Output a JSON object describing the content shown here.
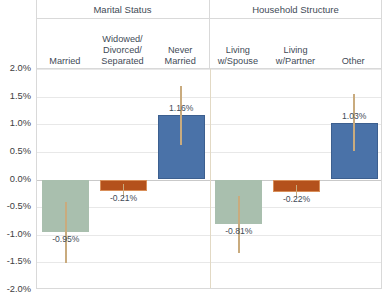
{
  "header": {
    "groups": [
      {
        "label": "Marital Status"
      },
      {
        "label": "Household Structure"
      }
    ],
    "categories": [
      {
        "lines": [
          "Married"
        ]
      },
      {
        "lines": [
          "Widowed/",
          "Divorced/",
          "Separated"
        ]
      },
      {
        "lines": [
          "Never",
          "Married"
        ]
      },
      {
        "lines": [
          "Living",
          "w/Spouse"
        ]
      },
      {
        "lines": [
          "Living",
          "w/Partner"
        ]
      },
      {
        "lines": [
          "Other"
        ]
      }
    ]
  },
  "axis": {
    "ticks": [
      "2.0%",
      "1.5%",
      "1.0%",
      "0.5%",
      "0.0%",
      "-0.5%",
      "-1.0%",
      "-1.5%",
      "-2.0%"
    ],
    "tick_values": [
      2.0,
      1.5,
      1.0,
      0.5,
      0.0,
      -0.5,
      -1.0,
      -1.5,
      -2.0
    ]
  },
  "colors": {
    "green": "#a9bfae",
    "green_border": "#a9bfae",
    "rust": "#b4511c",
    "rust_border": "#d98f5a",
    "blue": "#4a72a8",
    "blue_border": "#3c5f8f",
    "error": "#c9ab7e",
    "grid": "#e8e8e8",
    "zero": "#c9c9c9",
    "divider": "#d9d9d9",
    "text": "#3f4b57"
  },
  "chart_data": {
    "type": "bar",
    "title": "",
    "xlabel": "",
    "ylabel": "",
    "ylim": [
      -2.0,
      2.0
    ],
    "yticks": [
      -2.0,
      -1.5,
      -1.0,
      -0.5,
      0.0,
      0.5,
      1.0,
      1.5,
      2.0
    ],
    "grid": true,
    "legend": "none",
    "value_suffix": "%",
    "groups": [
      "Marital Status",
      "Household Structure"
    ],
    "categories": [
      "Married",
      "Widowed/ Divorced/ Separated",
      "Never Married",
      "Living w/Spouse",
      "Living w/Partner",
      "Other"
    ],
    "values": [
      -0.95,
      -0.21,
      1.16,
      -0.81,
      -0.22,
      1.03
    ],
    "labels": [
      "-0.95%",
      "-0.21%",
      "1.16%",
      "-0.81%",
      "-0.22%",
      "1.03%"
    ],
    "colors": [
      "green",
      "rust",
      "blue",
      "green",
      "rust",
      "blue"
    ],
    "error_bars": [
      {
        "low": -1.52,
        "high": -0.4
      },
      {
        "low": -0.33,
        "high": -0.09
      },
      {
        "low": 0.62,
        "high": 1.7
      },
      {
        "low": -1.33,
        "high": -0.3
      },
      {
        "low": -0.34,
        "high": -0.1
      },
      {
        "low": 0.52,
        "high": 1.54
      }
    ]
  }
}
